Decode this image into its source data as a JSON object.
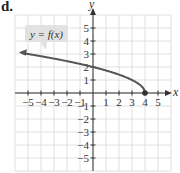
{
  "panel": {
    "label": "d."
  },
  "chart_data": {
    "type": "line",
    "title": "",
    "function_label": "y = f(x)",
    "function": "sqrt(4 - x)",
    "xlabel": "x",
    "ylabel": "y",
    "xlim": [
      -6,
      6
    ],
    "ylim": [
      -6,
      6
    ],
    "grid": true,
    "x_ticks": [
      -5,
      -4,
      -3,
      -2,
      -1,
      1,
      2,
      3,
      4,
      5
    ],
    "y_ticks": [
      5,
      4,
      3,
      2,
      1,
      -1,
      -2,
      -3,
      -4,
      -5
    ],
    "x_tick_labels": [
      "−5",
      "−4",
      "−3",
      "−2",
      "−1",
      "1",
      "2",
      "3",
      "4",
      "5"
    ],
    "y_tick_labels": [
      "5",
      "4",
      "3",
      "2",
      "1",
      "−1",
      "−2",
      "−3",
      "−4",
      "−5"
    ],
    "series": [
      {
        "name": "y = f(x)",
        "x": [
          -5.5,
          -5,
          -4,
          -3,
          -2,
          -1,
          0,
          1,
          2,
          3,
          3.5,
          3.9,
          4
        ],
        "y": [
          3.08,
          3,
          2.83,
          2.65,
          2.45,
          2.24,
          2,
          1.73,
          1.41,
          1,
          0.71,
          0.32,
          0
        ],
        "left_end": "arrow",
        "right_end": "closed-dot",
        "color": "#555555"
      }
    ],
    "endpoint": {
      "x": 4,
      "y": 0,
      "style": "closed"
    }
  },
  "colors": {
    "grid": "#d8d8d8",
    "axis": "#333333",
    "curve": "#555555",
    "callout_bg": "#e2e2e2"
  }
}
